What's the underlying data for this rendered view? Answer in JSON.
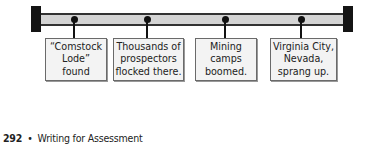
{
  "timeline": {
    "events": [
      {
        "lines": [
          "“Comstock",
          "Lode”",
          "found"
        ]
      },
      {
        "lines": [
          "Thousands of",
          "prospectors",
          "flocked there."
        ]
      },
      {
        "lines": [
          "Mining",
          "camps",
          "boomed."
        ]
      },
      {
        "lines": [
          "Virginia City,",
          "Nevada,",
          "sprang up."
        ]
      }
    ]
  },
  "footer": {
    "page_number": "292",
    "bullet": "•",
    "section_title": "Writing for Assessment"
  }
}
